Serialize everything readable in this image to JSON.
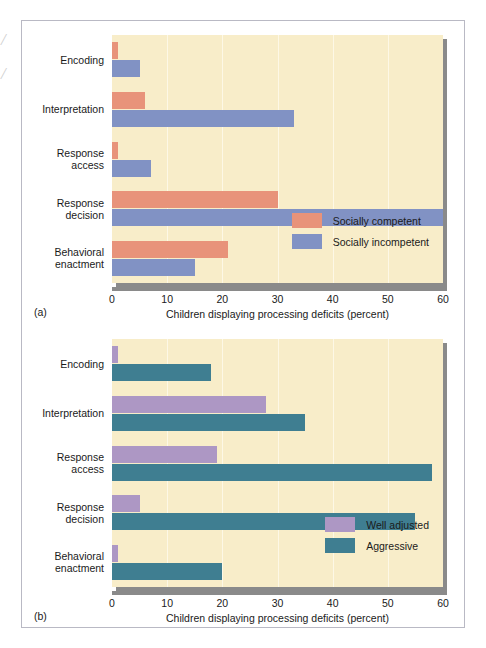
{
  "figure": {
    "edge_artifacts": [
      "/",
      "/"
    ],
    "axis_title": "Children displaying processing deficits (percent)",
    "panel_a_tag": "(a)",
    "panel_b_tag": "(b)",
    "tick_labels": [
      "0",
      "10",
      "20",
      "30",
      "40",
      "50",
      "60"
    ],
    "colors": {
      "plot_background": "#f8edc9",
      "gridline": "#fdf8e6",
      "shadow": "#8a8a8a",
      "frame": "#b9b9c4",
      "socially_competent": "#e8937a",
      "socially_incompetent": "#8192c4",
      "well_adjusted": "#ad97c4",
      "aggressive": "#3f7e91"
    }
  },
  "chart_data": [
    {
      "type": "bar",
      "orientation": "horizontal",
      "panel": "(a)",
      "title": "",
      "xlabel": "Children displaying processing deficits (percent)",
      "ylabel": "",
      "xlim": [
        0,
        60
      ],
      "xticks": [
        0,
        10,
        20,
        30,
        40,
        50,
        60
      ],
      "grid": true,
      "legend_position": "inside-bottom-right",
      "categories": [
        "Encoding",
        "Interpretation",
        "Response\naccess",
        "Response\ndecision",
        "Behavioral\nenactment"
      ],
      "series": [
        {
          "name": "Socially competent",
          "color": "#e8937a",
          "values": [
            1,
            6,
            1,
            30,
            21
          ]
        },
        {
          "name": "Socially incompetent",
          "color": "#8192c4",
          "values": [
            5,
            33,
            7,
            60,
            15
          ]
        }
      ]
    },
    {
      "type": "bar",
      "orientation": "horizontal",
      "panel": "(b)",
      "title": "",
      "xlabel": "Children displaying processing deficits (percent)",
      "ylabel": "",
      "xlim": [
        0,
        60
      ],
      "xticks": [
        0,
        10,
        20,
        30,
        40,
        50,
        60
      ],
      "grid": true,
      "legend_position": "inside-bottom-right",
      "categories": [
        "Encoding",
        "Interpretation",
        "Response\naccess",
        "Response\ndecision",
        "Behavioral\nenactment"
      ],
      "series": [
        {
          "name": "Well adjusted",
          "color": "#ad97c4",
          "values": [
            1,
            28,
            19,
            5,
            1
          ]
        },
        {
          "name": "Aggressive",
          "color": "#3f7e91",
          "values": [
            18,
            35,
            58,
            55,
            20
          ]
        }
      ]
    }
  ]
}
